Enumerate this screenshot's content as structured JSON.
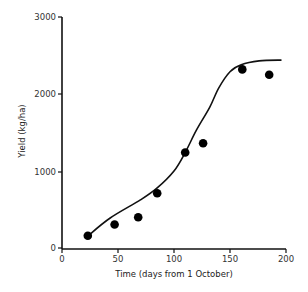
{
  "chart_data": {
    "type": "scatter",
    "title": "",
    "xlabel": "Time (days from 1 October)",
    "ylabel": "Yield (kg/ha)",
    "xlim": [
      0,
      200
    ],
    "ylim": [
      0,
      3000
    ],
    "xticks": [
      0,
      50,
      100,
      150,
      200
    ],
    "yticks": [
      0,
      1000,
      2000,
      3000
    ],
    "grid": false,
    "legend": null,
    "series": [
      {
        "name": "Observed yield",
        "kind": "scatter",
        "marker": "filled-circle",
        "x": [
          23,
          47,
          68,
          85,
          110,
          126,
          161,
          185
        ],
        "y": [
          160,
          305,
          400,
          710,
          1240,
          1360,
          2320,
          2250
        ]
      },
      {
        "name": "Fitted curve",
        "kind": "line",
        "x": [
          23,
          43,
          70,
          85,
          100,
          110,
          120,
          132,
          140,
          150,
          160,
          176,
          196
        ],
        "y": [
          155,
          390,
          625,
          780,
          1000,
          1240,
          1530,
          1830,
          2080,
          2290,
          2380,
          2430,
          2440
        ]
      }
    ]
  },
  "labels": {
    "xlabel": "Time (days from 1 October)",
    "ylabel": "Yield (kg/ha)",
    "xticks": [
      "0",
      "50",
      "100",
      "150",
      "200"
    ],
    "yticks": [
      "0",
      "1000",
      "2000",
      "3000"
    ]
  }
}
